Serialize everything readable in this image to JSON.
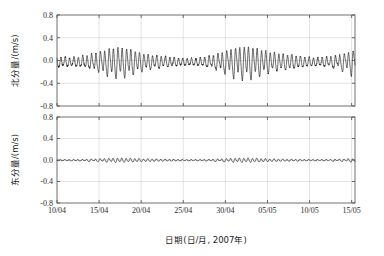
{
  "figure": {
    "width": 384,
    "height": 256,
    "background": "#ffffff",
    "trace_color": "#1a1a1a",
    "grid_color": "#d0d0d0",
    "axis_color": "#4d4d4d",
    "xlabel": "日期(日/月, 2007年)"
  },
  "chart_data": [
    {
      "type": "line",
      "title": "",
      "panel": "top",
      "xlabel": "日期(日/月, 2007年)",
      "ylabel": "北分量/(m/s)",
      "xtick_labels": [
        "10/04",
        "15/04",
        "20/04",
        "25/04",
        "30/04",
        "05/05",
        "10/05",
        "15/05"
      ],
      "xtick_days": [
        0,
        5,
        10,
        15,
        20,
        25,
        30,
        35
      ],
      "ytick_labels": [
        "0.8",
        "0.4",
        "0.0",
        "-0.4",
        "-0.8"
      ],
      "ytick_values": [
        0.8,
        0.4,
        0.0,
        -0.4,
        -0.8
      ],
      "ylim": [
        -0.8,
        0.8
      ],
      "xlim": [
        0,
        35.4
      ],
      "grid": true,
      "legend": "none",
      "series": [
        {
          "name": "北分量",
          "units": "m/s",
          "description": "semidiurnal tidal north velocity with spring-neap envelope",
          "sampling_per_day": 24,
          "mean": -0.03,
          "max": 0.45,
          "min": -0.45,
          "synth": {
            "offset": -0.03,
            "components": [
              {
                "amp_base": 0.135,
                "period_days": 0.5175,
                "phase": 0.35
              },
              {
                "amp_base": 0.052,
                "period_days": 0.5,
                "phase": 1.9
              },
              {
                "amp_base": 0.03,
                "period_days": 1.0758,
                "phase": 0.7
              },
              {
                "amp_base": 0.018,
                "period_days": 0.9973,
                "phase": 2.4
              },
              {
                "amp_base": 0.022,
                "period_days": 0.2586,
                "phase": 1.1
              }
            ],
            "envelope": [
              {
                "amp": 0.62,
                "period_days": 14.77,
                "phase": 3.55
              },
              {
                "amp": 0.16,
                "period_days": 7.4,
                "phase": 1.2
              },
              {
                "amp": 0.1,
                "period_days": 27.55,
                "phase": 0.4
              }
            ],
            "noise": 0.012
          }
        }
      ]
    },
    {
      "type": "line",
      "title": "",
      "panel": "bottom",
      "xlabel": "日期(日/月, 2007年)",
      "ylabel": "东分量/(m/s)",
      "xtick_labels": [
        "10/04",
        "15/04",
        "20/04",
        "25/04",
        "30/04",
        "05/05",
        "10/05",
        "15/05"
      ],
      "xtick_days": [
        0,
        5,
        10,
        15,
        20,
        25,
        30,
        35
      ],
      "ytick_labels": [
        "0.8",
        "0.4",
        "0.0",
        "-0.4",
        "-0.8"
      ],
      "ytick_values": [
        0.8,
        0.4,
        0.0,
        -0.4,
        -0.8
      ],
      "ylim": [
        -0.8,
        0.8
      ],
      "xlim": [
        0,
        35.4
      ],
      "grid": true,
      "legend": "none",
      "series": [
        {
          "name": "东分量",
          "units": "m/s",
          "description": "small-amplitude semidiurnal tidal east velocity",
          "sampling_per_day": 24,
          "mean": -0.005,
          "max": 0.065,
          "min": -0.055,
          "synth": {
            "offset": -0.005,
            "components": [
              {
                "amp_base": 0.021,
                "period_days": 0.5175,
                "phase": 1.05
              },
              {
                "amp_base": 0.008,
                "period_days": 0.5,
                "phase": 2.6
              },
              {
                "amp_base": 0.005,
                "period_days": 1.0758,
                "phase": 0.2
              },
              {
                "amp_base": 0.004,
                "period_days": 0.2586,
                "phase": 2.0
              }
            ],
            "envelope": [
              {
                "amp": 0.55,
                "period_days": 14.77,
                "phase": 3.55
              },
              {
                "amp": 0.14,
                "period_days": 7.4,
                "phase": 1.2
              }
            ],
            "noise": 0.0028
          }
        }
      ]
    }
  ]
}
